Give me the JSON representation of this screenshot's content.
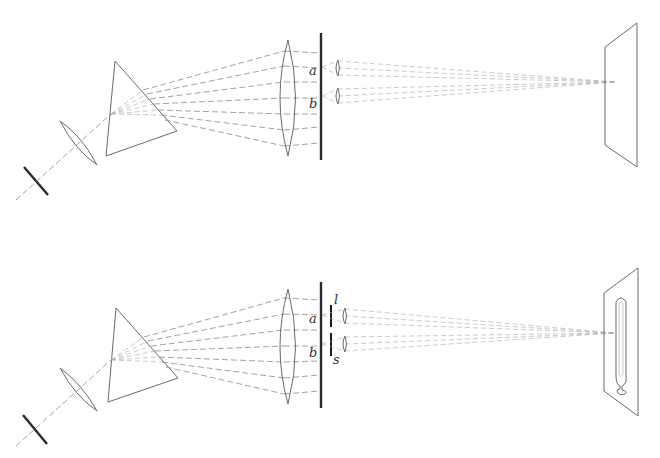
{
  "diagram": {
    "type": "optics-spectroscope-schematic",
    "panels": [
      {
        "id": "top",
        "components": [
          "slit",
          "collimator-lens",
          "prism",
          "objective-lens",
          "aperture-screen",
          "small-lenses",
          "projection-screen"
        ],
        "labels": {
          "a": "a",
          "b": "b"
        }
      },
      {
        "id": "bottom",
        "components": [
          "slit",
          "collimator-lens",
          "prism",
          "objective-lens",
          "aperture-screen",
          "filter-bars",
          "small-lenses",
          "screen-with-thermometer"
        ],
        "labels": {
          "a": "a",
          "b": "b",
          "l": "l",
          "s": "s"
        }
      }
    ],
    "colors": {
      "ink": "#2a2a2a",
      "ray": "#8a8a8a",
      "outline": "#6a6a6a"
    }
  }
}
